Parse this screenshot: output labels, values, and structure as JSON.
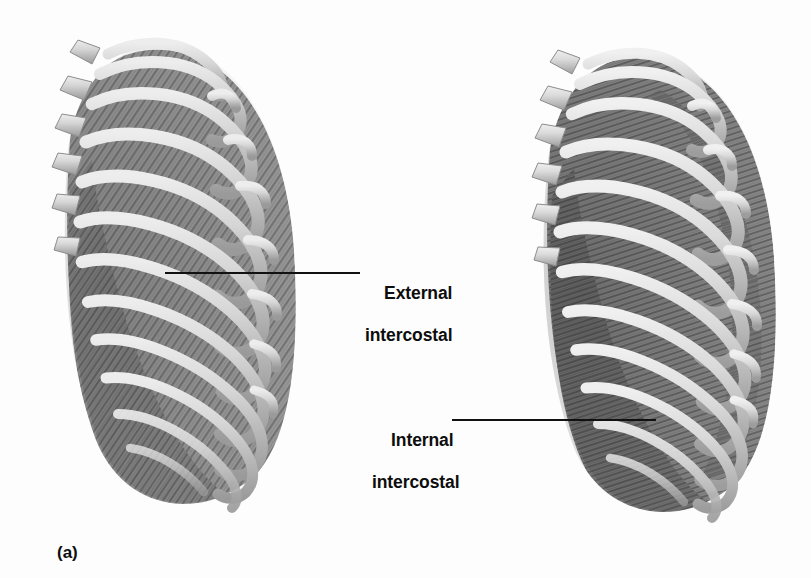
{
  "figure": {
    "caption": "(a)",
    "background_color": "#fdfdfd",
    "text_color": "#0d0d0d",
    "bone_color": "#cfcfcf",
    "bone_highlight_color": "#ededed",
    "bone_shadow_color": "#9a9a9a",
    "muscle_light_color": "#9e9e9e",
    "muscle_dark_color": "#6f6f6f",
    "leader_line_color": "#111111"
  },
  "labels": {
    "external": {
      "line1": "External",
      "line2": "intercostal",
      "leader": {
        "x1": 165,
        "y1": 273,
        "x2": 360,
        "y2": 273
      }
    },
    "internal": {
      "line1": "Internal",
      "line2": "intercostal",
      "leader": {
        "x1": 452,
        "y1": 420,
        "x2": 656,
        "y2": 420
      }
    }
  },
  "panels": [
    {
      "name": "left-ribcage",
      "description": "Lateral view of thoracic cage showing external intercostal muscles",
      "muscle_layer": "external intercostal",
      "rib_count": 11,
      "vertebra_count": 6
    },
    {
      "name": "right-ribcage",
      "description": "Lateral view of thoracic cage showing internal intercostal muscles",
      "muscle_layer": "internal intercostal",
      "rib_count": 11,
      "vertebra_count": 6
    }
  ]
}
